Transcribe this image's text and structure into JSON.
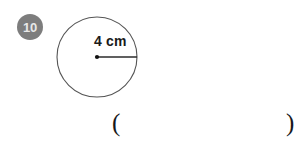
{
  "worksheet": {
    "question_number": "10",
    "figure": {
      "shape": "circle",
      "radius_label": "4 cm",
      "center_dot": true,
      "radius_line": true,
      "stroke_color": "#555555",
      "fill_color": "#ffffff"
    },
    "badge": {
      "background_color": "#7d7d7d",
      "text_color": "#e8e8e8"
    },
    "answer": {
      "paren_open": "(",
      "paren_close": ")",
      "value": "",
      "placeholder": ""
    }
  }
}
